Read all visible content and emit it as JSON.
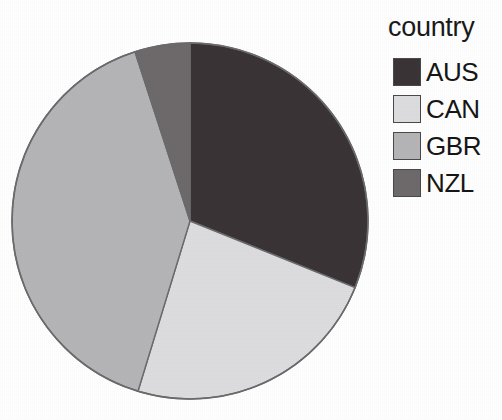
{
  "legend": {
    "title": "country",
    "entries": [
      {
        "label": "AUS",
        "color": "#3a3436"
      },
      {
        "label": "CAN",
        "color": "#dddddf"
      },
      {
        "label": "GBR",
        "color": "#b5b5b7"
      },
      {
        "label": "NZL",
        "color": "#6e6a6c"
      }
    ]
  },
  "chart_data": {
    "type": "pie",
    "title": "",
    "legend_title": "country",
    "legend_position": "right",
    "categories": [
      "AUS",
      "CAN",
      "GBR",
      "NZL"
    ],
    "values": [
      31.1,
      23.6,
      40.3,
      5.0
    ],
    "units": "percent",
    "colors": [
      "#3a3436",
      "#dddddf",
      "#b5b5b7",
      "#6e6a6c"
    ],
    "start_angle_deg": 0,
    "direction": "clockwise",
    "slices": [
      {
        "label": "AUS",
        "value": 31.1,
        "start_angle_deg": 0.0,
        "end_angle_deg": 112.0,
        "color": "#3a3436"
      },
      {
        "label": "CAN",
        "value": 23.6,
        "start_angle_deg": 112.0,
        "end_angle_deg": 197.0,
        "color": "#dddddf"
      },
      {
        "label": "GBR",
        "value": 40.3,
        "start_angle_deg": 197.0,
        "end_angle_deg": 342.0,
        "color": "#b5b5b7"
      },
      {
        "label": "NZL",
        "value": 5.0,
        "start_angle_deg": 342.0,
        "end_angle_deg": 360.0,
        "color": "#6e6a6c"
      }
    ],
    "geometry": {
      "center_x": 190,
      "center_y": 221,
      "radius": 178
    },
    "grid": false,
    "xlabel": "",
    "ylabel": ""
  }
}
